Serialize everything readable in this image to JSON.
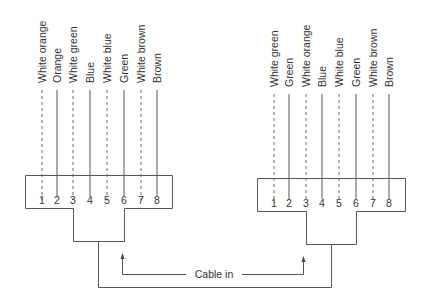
{
  "diagram": {
    "left_connector": {
      "wires": [
        {
          "pin": "1",
          "label": "White orange",
          "style": "dashed"
        },
        {
          "pin": "2",
          "label": "Orange",
          "style": "solid"
        },
        {
          "pin": "3",
          "label": "White green",
          "style": "dashed"
        },
        {
          "pin": "4",
          "label": "Blue",
          "style": "solid"
        },
        {
          "pin": "5",
          "label": "White blue",
          "style": "dashed"
        },
        {
          "pin": "6",
          "label": "Green",
          "style": "solid"
        },
        {
          "pin": "7",
          "label": "White brown",
          "style": "dashed"
        },
        {
          "pin": "8",
          "label": "Brown",
          "style": "solid"
        }
      ]
    },
    "right_connector": {
      "wires": [
        {
          "pin": "1",
          "label": "White green",
          "style": "dashed"
        },
        {
          "pin": "2",
          "label": "Green",
          "style": "solid"
        },
        {
          "pin": "3",
          "label": "White orange",
          "style": "dashed"
        },
        {
          "pin": "4",
          "label": "Blue",
          "style": "solid"
        },
        {
          "pin": "5",
          "label": "White blue",
          "style": "dashed"
        },
        {
          "pin": "6",
          "label": "Green",
          "style": "solid"
        },
        {
          "pin": "7",
          "label": "White brown",
          "style": "dashed"
        },
        {
          "pin": "8",
          "label": "Brown",
          "style": "solid"
        }
      ]
    },
    "cable_label": "Cable in"
  }
}
